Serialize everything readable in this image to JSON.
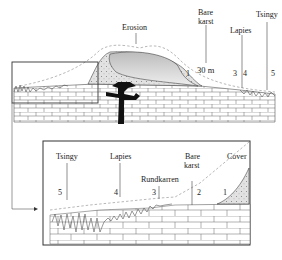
{
  "figure": {
    "top_panel": {
      "labels": {
        "erosion": "Erosion",
        "bare_karst": "Bare karst",
        "bare_karst_line1": "Bare",
        "bare_karst_line2": "karst",
        "lapies": "Lapies",
        "tsingy": "Tsingy",
        "scale": "30 m"
      },
      "zone_numbers": [
        "1",
        "3",
        "4",
        "5"
      ]
    },
    "inset_panel": {
      "labels": {
        "tsingy": "Tsingy",
        "lapies": "Lapies",
        "rundkarren": "Rundkarren",
        "bare_line1": "Bare",
        "bare_line2": "karst",
        "cover": "Cover"
      },
      "zone_numbers": [
        "5",
        "4",
        "3",
        "2",
        "1"
      ]
    },
    "colors": {
      "line": "#333333",
      "dashed": "#999999",
      "cover_fill": "#d9d9d9",
      "root": "#111111"
    }
  }
}
